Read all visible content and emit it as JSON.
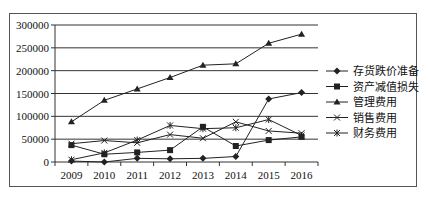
{
  "chart_data": {
    "type": "line",
    "title": "",
    "xlabel": "",
    "ylabel": "",
    "categories": [
      "2009",
      "2010",
      "2011",
      "2012",
      "2013",
      "2014",
      "2015",
      "2016"
    ],
    "ylim": [
      0,
      300000
    ],
    "yticks": [
      0,
      50000,
      100000,
      150000,
      200000,
      250000,
      300000
    ],
    "ytick_labels": [
      "0",
      "50000",
      "100000",
      "150000",
      "200000",
      "250000",
      "300000"
    ],
    "grid": true,
    "legend_position": "right",
    "series": [
      {
        "name": "存货跌价准备",
        "marker": "diamond",
        "values": [
          2000,
          0,
          8000,
          7000,
          8000,
          12000,
          138000,
          152000
        ]
      },
      {
        "name": "资产减值损失",
        "marker": "square",
        "values": [
          37000,
          17000,
          21000,
          26000,
          77000,
          35000,
          48000,
          55000
        ]
      },
      {
        "name": "管理费用",
        "marker": "triangle",
        "values": [
          88000,
          135000,
          160000,
          185000,
          212000,
          215000,
          260000,
          280000
        ]
      },
      {
        "name": "销售费用",
        "marker": "x",
        "values": [
          40000,
          47000,
          42000,
          60000,
          52000,
          88000,
          68000,
          63000
        ]
      },
      {
        "name": "财务费用",
        "marker": "asterisk",
        "values": [
          5000,
          20000,
          48000,
          80000,
          73000,
          75000,
          93000,
          58000
        ]
      }
    ]
  },
  "colors": {
    "line": "#222222",
    "grid": "#333333",
    "frame": "#555555"
  }
}
